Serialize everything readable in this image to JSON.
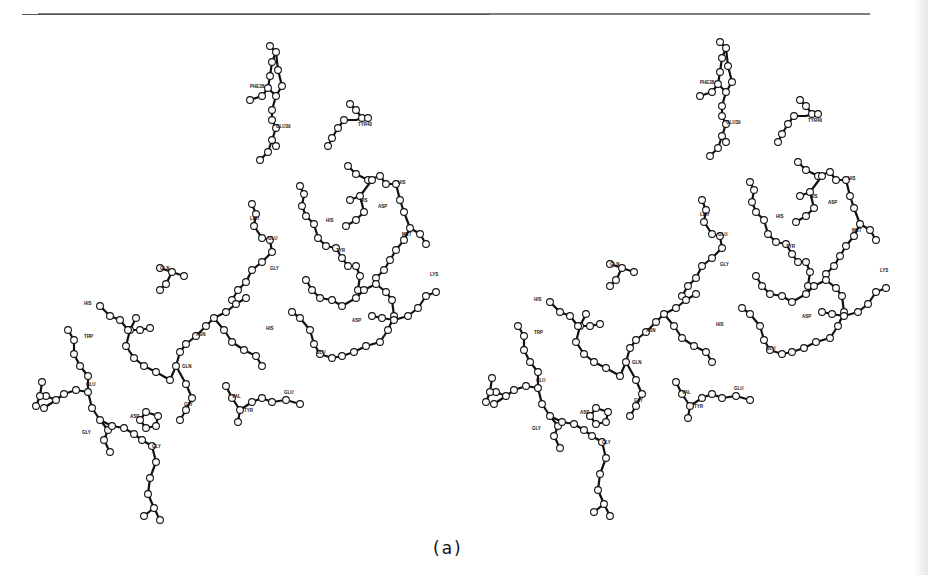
{
  "figure": {
    "caption": "(a)",
    "type": "stereo-pair ball-and-stick molecular model",
    "stereo_offset_x": 450,
    "colors": {
      "ink": "#111111",
      "atom_fill": "#ffffff",
      "rule": "#555555"
    }
  },
  "labels": [
    {
      "text": "PHE38",
      "x": 250,
      "y": 88
    },
    {
      "text": "GLU39",
      "x": 276,
      "y": 128
    },
    {
      "text": "TYR40",
      "x": 358,
      "y": 126
    },
    {
      "text": "HIS",
      "x": 398,
      "y": 184
    },
    {
      "text": "HIS",
      "x": 360,
      "y": 202
    },
    {
      "text": "ASP",
      "x": 378,
      "y": 208
    },
    {
      "text": "MET",
      "x": 402,
      "y": 236
    },
    {
      "text": "LYS",
      "x": 430,
      "y": 276
    },
    {
      "text": "GLU",
      "x": 268,
      "y": 240
    },
    {
      "text": "GLY",
      "x": 270,
      "y": 270
    },
    {
      "text": "HIS",
      "x": 326,
      "y": 222
    },
    {
      "text": "LEU",
      "x": 250,
      "y": 220
    },
    {
      "text": "TYR",
      "x": 336,
      "y": 252
    },
    {
      "text": "ASP",
      "x": 352,
      "y": 322
    },
    {
      "text": "GLU",
      "x": 316,
      "y": 354
    },
    {
      "text": "HIS",
      "x": 266,
      "y": 330
    },
    {
      "text": "GLN",
      "x": 160,
      "y": 270
    },
    {
      "text": "ASN",
      "x": 196,
      "y": 336
    },
    {
      "text": "GLN",
      "x": 182,
      "y": 368
    },
    {
      "text": "HIS",
      "x": 84,
      "y": 305
    },
    {
      "text": "TRP",
      "x": 84,
      "y": 338
    },
    {
      "text": "GLU",
      "x": 86,
      "y": 386
    },
    {
      "text": "GLY",
      "x": 184,
      "y": 406
    },
    {
      "text": "GLY",
      "x": 82,
      "y": 434
    },
    {
      "text": "GLY",
      "x": 152,
      "y": 448
    },
    {
      "text": "VAL",
      "x": 232,
      "y": 398
    },
    {
      "text": "TYR",
      "x": 244,
      "y": 412
    },
    {
      "text": "GLU",
      "x": 284,
      "y": 394
    },
    {
      "text": "ASP",
      "x": 130,
      "y": 418
    }
  ],
  "bonds": [
    [
      270,
      46,
      276,
      52
    ],
    [
      276,
      52,
      272,
      62
    ],
    [
      272,
      62,
      270,
      76
    ],
    [
      270,
      76,
      268,
      88
    ],
    [
      268,
      88,
      276,
      96
    ],
    [
      276,
      96,
      282,
      86
    ],
    [
      282,
      86,
      278,
      70
    ],
    [
      278,
      70,
      276,
      52
    ],
    [
      268,
      88,
      262,
      96
    ],
    [
      262,
      96,
      250,
      100
    ],
    [
      276,
      96,
      272,
      110
    ],
    [
      272,
      110,
      272,
      120
    ],
    [
      272,
      120,
      276,
      128
    ],
    [
      276,
      128,
      272,
      140
    ],
    [
      272,
      140,
      276,
      146
    ],
    [
      272,
      140,
      268,
      152
    ],
    [
      268,
      152,
      260,
      160
    ],
    [
      350,
      104,
      356,
      110
    ],
    [
      356,
      110,
      362,
      118
    ],
    [
      362,
      118,
      356,
      120
    ],
    [
      356,
      120,
      344,
      120
    ],
    [
      344,
      120,
      338,
      128
    ],
    [
      338,
      128,
      332,
      138
    ],
    [
      332,
      138,
      328,
      146
    ],
    [
      362,
      118,
      368,
      118
    ],
    [
      348,
      166,
      356,
      174
    ],
    [
      356,
      174,
      368,
      180
    ],
    [
      368,
      180,
      380,
      176
    ],
    [
      380,
      176,
      386,
      184
    ],
    [
      386,
      184,
      396,
      184
    ],
    [
      396,
      184,
      400,
      200
    ],
    [
      400,
      200,
      404,
      212
    ],
    [
      404,
      212,
      410,
      228
    ],
    [
      410,
      228,
      420,
      234
    ],
    [
      420,
      234,
      426,
      244
    ],
    [
      410,
      228,
      404,
      240
    ],
    [
      404,
      240,
      396,
      250
    ],
    [
      396,
      250,
      390,
      260
    ],
    [
      390,
      260,
      384,
      270
    ],
    [
      384,
      270,
      376,
      278
    ],
    [
      372,
      180,
      360,
      196
    ],
    [
      360,
      196,
      350,
      200
    ],
    [
      360,
      196,
      364,
      212
    ],
    [
      364,
      212,
      356,
      220
    ],
    [
      356,
      220,
      346,
      226
    ],
    [
      300,
      186,
      304,
      194
    ],
    [
      304,
      194,
      302,
      206
    ],
    [
      302,
      206,
      306,
      216
    ],
    [
      306,
      216,
      314,
      224
    ],
    [
      314,
      224,
      318,
      238
    ],
    [
      318,
      238,
      326,
      246
    ],
    [
      326,
      246,
      336,
      248
    ],
    [
      336,
      248,
      342,
      258
    ],
    [
      342,
      258,
      348,
      266
    ],
    [
      348,
      266,
      356,
      266
    ],
    [
      356,
      266,
      360,
      276
    ],
    [
      360,
      276,
      358,
      290
    ],
    [
      252,
      204,
      256,
      214
    ],
    [
      256,
      214,
      254,
      226
    ],
    [
      254,
      226,
      262,
      238
    ],
    [
      262,
      238,
      270,
      240
    ],
    [
      270,
      240,
      272,
      252
    ],
    [
      272,
      252,
      262,
      262
    ],
    [
      262,
      262,
      252,
      270
    ],
    [
      252,
      270,
      246,
      282
    ],
    [
      246,
      282,
      238,
      290
    ],
    [
      238,
      290,
      232,
      300
    ],
    [
      160,
      268,
      172,
      272
    ],
    [
      172,
      272,
      184,
      276
    ],
    [
      172,
      272,
      166,
      284
    ],
    [
      166,
      284,
      160,
      290
    ],
    [
      306,
      280,
      312,
      290
    ],
    [
      312,
      290,
      320,
      298
    ],
    [
      320,
      298,
      332,
      300
    ],
    [
      332,
      300,
      342,
      306
    ],
    [
      342,
      306,
      356,
      298
    ],
    [
      356,
      298,
      364,
      290
    ],
    [
      364,
      290,
      376,
      284
    ],
    [
      376,
      284,
      386,
      292
    ],
    [
      386,
      292,
      392,
      300
    ],
    [
      392,
      300,
      394,
      316
    ],
    [
      394,
      316,
      388,
      330
    ],
    [
      388,
      330,
      380,
      342
    ],
    [
      380,
      342,
      366,
      346
    ],
    [
      366,
      346,
      354,
      352
    ],
    [
      354,
      352,
      342,
      356
    ],
    [
      342,
      356,
      332,
      358
    ],
    [
      332,
      358,
      320,
      354
    ],
    [
      320,
      354,
      314,
      344
    ],
    [
      314,
      344,
      310,
      330
    ],
    [
      310,
      330,
      300,
      318
    ],
    [
      300,
      318,
      292,
      312
    ],
    [
      246,
      298,
      236,
      304
    ],
    [
      236,
      304,
      226,
      312
    ],
    [
      226,
      312,
      214,
      318
    ],
    [
      214,
      318,
      206,
      326
    ],
    [
      206,
      326,
      196,
      336
    ],
    [
      196,
      336,
      186,
      344
    ],
    [
      186,
      344,
      180,
      352
    ],
    [
      180,
      352,
      176,
      366
    ],
    [
      176,
      366,
      170,
      380
    ],
    [
      176,
      366,
      186,
      384
    ],
    [
      186,
      384,
      192,
      398
    ],
    [
      192,
      398,
      186,
      410
    ],
    [
      186,
      410,
      180,
      420
    ],
    [
      214,
      318,
      224,
      330
    ],
    [
      224,
      330,
      232,
      342
    ],
    [
      232,
      342,
      244,
      350
    ],
    [
      244,
      350,
      256,
      356
    ],
    [
      256,
      356,
      262,
      366
    ],
    [
      136,
      318,
      130,
      330
    ],
    [
      130,
      330,
      126,
      346
    ],
    [
      126,
      346,
      134,
      358
    ],
    [
      134,
      358,
      144,
      366
    ],
    [
      144,
      366,
      156,
      372
    ],
    [
      156,
      372,
      170,
      380
    ],
    [
      100,
      306,
      110,
      316
    ],
    [
      110,
      316,
      120,
      320
    ],
    [
      120,
      320,
      128,
      330
    ],
    [
      128,
      330,
      140,
      330
    ],
    [
      140,
      330,
      150,
      328
    ],
    [
      68,
      330,
      74,
      340
    ],
    [
      74,
      340,
      74,
      354
    ],
    [
      74,
      354,
      80,
      366
    ],
    [
      80,
      366,
      88,
      376
    ],
    [
      88,
      376,
      88,
      392
    ],
    [
      88,
      392,
      92,
      408
    ],
    [
      92,
      408,
      100,
      420
    ],
    [
      100,
      420,
      108,
      430
    ],
    [
      108,
      430,
      104,
      440
    ],
    [
      104,
      440,
      110,
      452
    ],
    [
      88,
      392,
      76,
      390
    ],
    [
      76,
      390,
      64,
      394
    ],
    [
      64,
      394,
      56,
      400
    ],
    [
      56,
      400,
      46,
      396
    ],
    [
      56,
      400,
      44,
      408
    ],
    [
      100,
      420,
      112,
      426
    ],
    [
      112,
      426,
      124,
      428
    ],
    [
      124,
      428,
      134,
      434
    ],
    [
      134,
      434,
      142,
      440
    ],
    [
      142,
      440,
      152,
      446
    ],
    [
      152,
      446,
      156,
      462
    ],
    [
      156,
      462,
      150,
      478
    ],
    [
      150,
      478,
      148,
      494
    ],
    [
      148,
      494,
      154,
      508
    ],
    [
      154,
      508,
      160,
      520
    ],
    [
      154,
      508,
      144,
      516
    ],
    [
      146,
      412,
      140,
      420
    ],
    [
      140,
      420,
      146,
      428
    ],
    [
      146,
      428,
      156,
      426
    ],
    [
      156,
      426,
      158,
      416
    ],
    [
      158,
      416,
      146,
      412
    ],
    [
      226,
      386,
      232,
      398
    ],
    [
      232,
      398,
      240,
      410
    ],
    [
      240,
      410,
      238,
      422
    ],
    [
      240,
      410,
      252,
      402
    ],
    [
      252,
      402,
      262,
      398
    ],
    [
      262,
      398,
      272,
      402
    ],
    [
      272,
      402,
      286,
      400
    ],
    [
      286,
      400,
      300,
      404
    ],
    [
      372,
      316,
      382,
      318
    ],
    [
      382,
      318,
      394,
      320
    ],
    [
      394,
      320,
      408,
      316
    ],
    [
      408,
      316,
      418,
      308
    ],
    [
      418,
      308,
      426,
      296
    ],
    [
      426,
      296,
      436,
      292
    ],
    [
      42,
      382,
      40,
      396
    ],
    [
      40,
      396,
      36,
      406
    ]
  ],
  "atoms": [
    [
      270,
      46
    ],
    [
      276,
      52
    ],
    [
      272,
      62
    ],
    [
      270,
      76
    ],
    [
      268,
      88
    ],
    [
      276,
      96
    ],
    [
      282,
      86
    ],
    [
      278,
      70
    ],
    [
      262,
      96
    ],
    [
      250,
      100
    ],
    [
      272,
      110
    ],
    [
      272,
      120
    ],
    [
      276,
      128
    ],
    [
      272,
      140
    ],
    [
      276,
      146
    ],
    [
      268,
      152
    ],
    [
      260,
      160
    ],
    [
      350,
      104
    ],
    [
      356,
      110
    ],
    [
      362,
      118
    ],
    [
      344,
      120
    ],
    [
      338,
      128
    ],
    [
      332,
      138
    ],
    [
      328,
      146
    ],
    [
      368,
      118
    ],
    [
      348,
      166
    ],
    [
      356,
      174
    ],
    [
      368,
      180
    ],
    [
      380,
      176
    ],
    [
      386,
      184
    ],
    [
      396,
      184
    ],
    [
      400,
      200
    ],
    [
      404,
      212
    ],
    [
      410,
      228
    ],
    [
      420,
      234
    ],
    [
      426,
      244
    ],
    [
      404,
      240
    ],
    [
      396,
      250
    ],
    [
      390,
      260
    ],
    [
      384,
      270
    ],
    [
      376,
      278
    ],
    [
      372,
      180
    ],
    [
      360,
      196
    ],
    [
      350,
      200
    ],
    [
      364,
      212
    ],
    [
      356,
      220
    ],
    [
      346,
      226
    ],
    [
      300,
      186
    ],
    [
      304,
      194
    ],
    [
      302,
      206
    ],
    [
      306,
      216
    ],
    [
      314,
      224
    ],
    [
      318,
      238
    ],
    [
      326,
      246
    ],
    [
      336,
      248
    ],
    [
      342,
      258
    ],
    [
      348,
      266
    ],
    [
      356,
      266
    ],
    [
      360,
      276
    ],
    [
      358,
      290
    ],
    [
      252,
      204
    ],
    [
      256,
      214
    ],
    [
      254,
      226
    ],
    [
      262,
      238
    ],
    [
      270,
      240
    ],
    [
      272,
      252
    ],
    [
      262,
      262
    ],
    [
      252,
      270
    ],
    [
      246,
      282
    ],
    [
      238,
      290
    ],
    [
      232,
      300
    ],
    [
      160,
      268
    ],
    [
      172,
      272
    ],
    [
      184,
      276
    ],
    [
      166,
      284
    ],
    [
      160,
      290
    ],
    [
      306,
      280
    ],
    [
      312,
      290
    ],
    [
      320,
      298
    ],
    [
      332,
      300
    ],
    [
      342,
      306
    ],
    [
      356,
      298
    ],
    [
      364,
      290
    ],
    [
      376,
      284
    ],
    [
      386,
      292
    ],
    [
      392,
      300
    ],
    [
      394,
      316
    ],
    [
      388,
      330
    ],
    [
      380,
      342
    ],
    [
      366,
      346
    ],
    [
      354,
      352
    ],
    [
      342,
      356
    ],
    [
      332,
      358
    ],
    [
      320,
      354
    ],
    [
      314,
      344
    ],
    [
      310,
      330
    ],
    [
      300,
      318
    ],
    [
      292,
      312
    ],
    [
      246,
      298
    ],
    [
      236,
      304
    ],
    [
      226,
      312
    ],
    [
      214,
      318
    ],
    [
      206,
      326
    ],
    [
      196,
      336
    ],
    [
      186,
      344
    ],
    [
      180,
      352
    ],
    [
      176,
      366
    ],
    [
      170,
      380
    ],
    [
      186,
      384
    ],
    [
      192,
      398
    ],
    [
      186,
      410
    ],
    [
      180,
      420
    ],
    [
      224,
      330
    ],
    [
      232,
      342
    ],
    [
      244,
      350
    ],
    [
      256,
      356
    ],
    [
      262,
      366
    ],
    [
      136,
      318
    ],
    [
      130,
      330
    ],
    [
      126,
      346
    ],
    [
      134,
      358
    ],
    [
      144,
      366
    ],
    [
      156,
      372
    ],
    [
      100,
      306
    ],
    [
      110,
      316
    ],
    [
      120,
      320
    ],
    [
      128,
      330
    ],
    [
      140,
      330
    ],
    [
      150,
      328
    ],
    [
      68,
      330
    ],
    [
      74,
      340
    ],
    [
      74,
      354
    ],
    [
      80,
      366
    ],
    [
      88,
      376
    ],
    [
      88,
      392
    ],
    [
      92,
      408
    ],
    [
      100,
      420
    ],
    [
      108,
      430
    ],
    [
      104,
      440
    ],
    [
      110,
      452
    ],
    [
      76,
      390
    ],
    [
      64,
      394
    ],
    [
      56,
      400
    ],
    [
      46,
      396
    ],
    [
      44,
      408
    ],
    [
      112,
      426
    ],
    [
      124,
      428
    ],
    [
      134,
      434
    ],
    [
      142,
      440
    ],
    [
      152,
      446
    ],
    [
      156,
      462
    ],
    [
      150,
      478
    ],
    [
      148,
      494
    ],
    [
      154,
      508
    ],
    [
      160,
      520
    ],
    [
      144,
      516
    ],
    [
      146,
      412
    ],
    [
      140,
      420
    ],
    [
      146,
      428
    ],
    [
      156,
      426
    ],
    [
      158,
      416
    ],
    [
      226,
      386
    ],
    [
      232,
      398
    ],
    [
      240,
      410
    ],
    [
      238,
      422
    ],
    [
      252,
      402
    ],
    [
      262,
      398
    ],
    [
      272,
      402
    ],
    [
      286,
      400
    ],
    [
      300,
      404
    ],
    [
      372,
      316
    ],
    [
      382,
      318
    ],
    [
      394,
      320
    ],
    [
      408,
      316
    ],
    [
      418,
      308
    ],
    [
      426,
      296
    ],
    [
      436,
      292
    ],
    [
      42,
      382
    ],
    [
      40,
      396
    ],
    [
      36,
      406
    ]
  ]
}
